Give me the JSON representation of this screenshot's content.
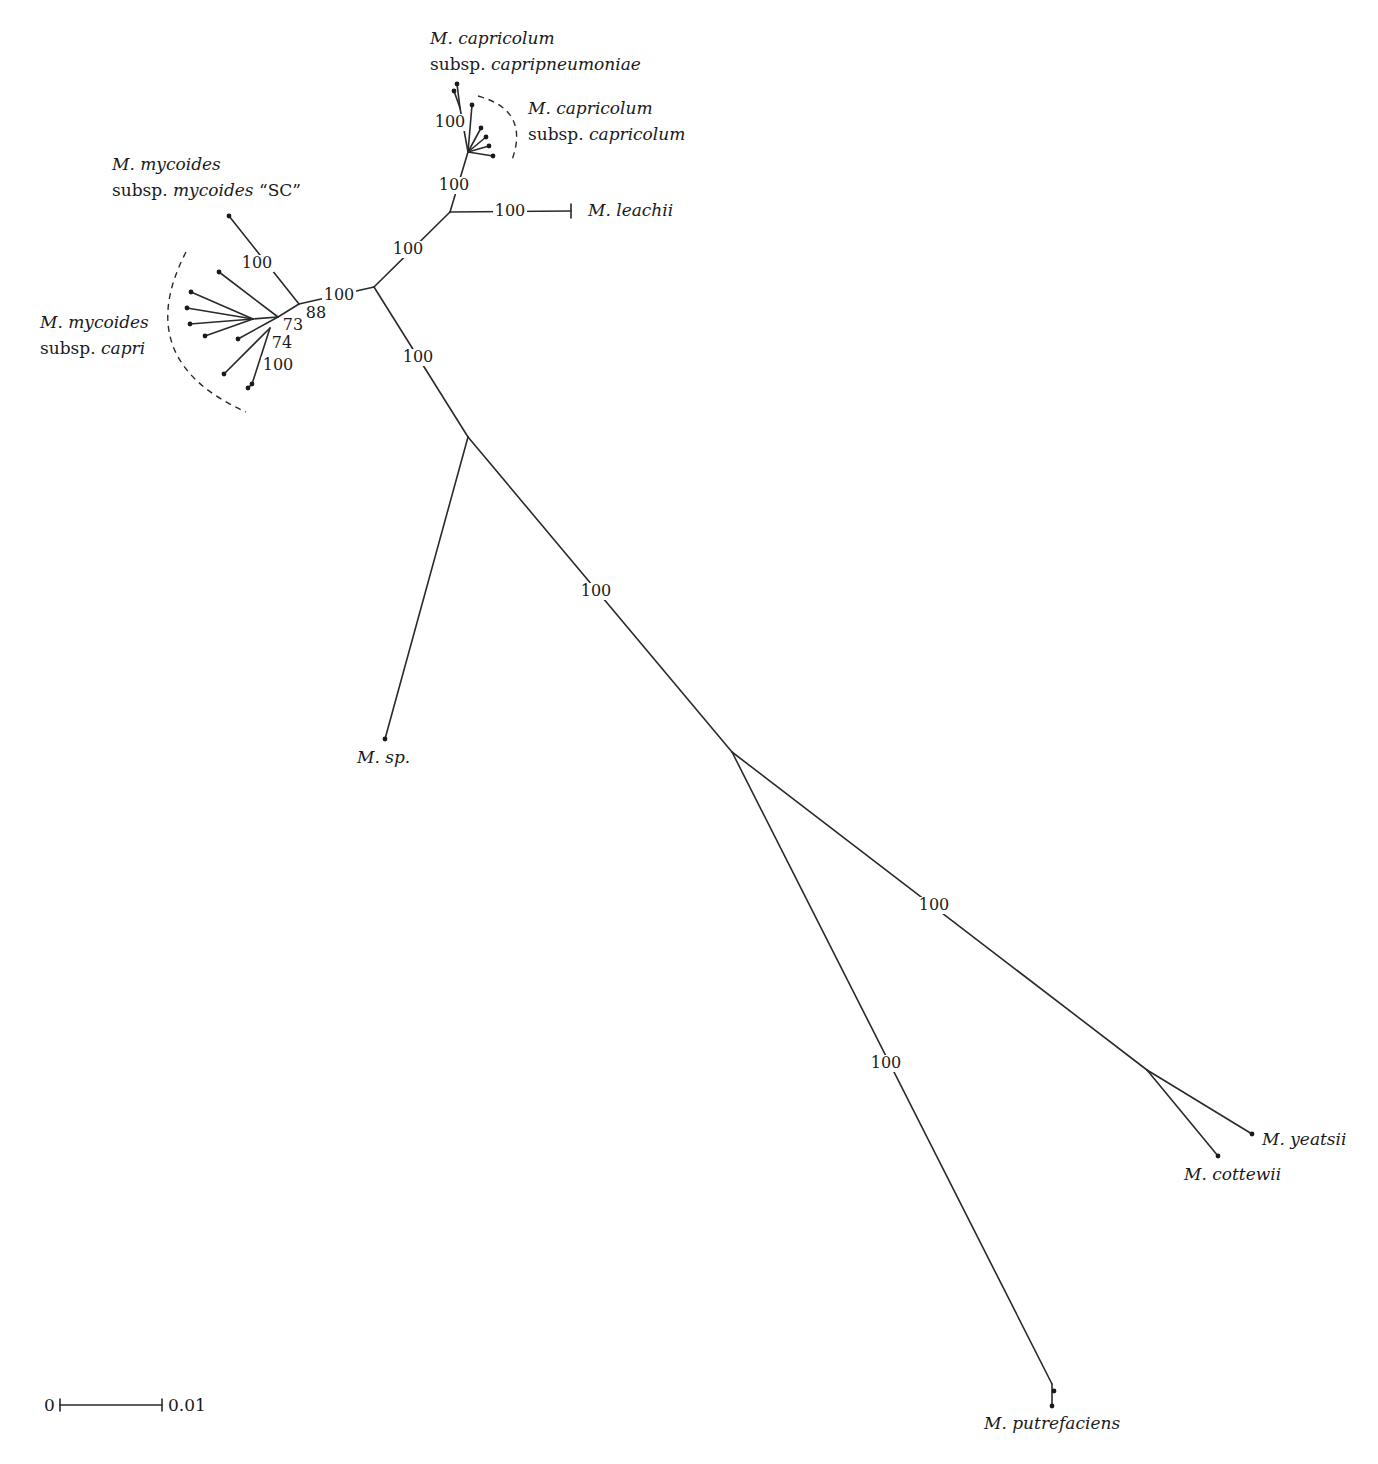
{
  "diagram": {
    "type": "unrooted phylogenetic tree",
    "scale_bar": {
      "left_label": "0",
      "right_label": "0.01",
      "x1": 60,
      "x2": 162,
      "y": 1405
    },
    "taxa": [
      {
        "id": "capripneumoniae",
        "line1": "M. capricolum",
        "line2_prefix": "subsp. ",
        "line2_italic": "capripneumoniae",
        "x": 430,
        "y1": 44,
        "y2": 70
      },
      {
        "id": "capricolum",
        "line1": "M. capricolum",
        "line2_prefix": "subsp. ",
        "line2_italic": "capricolum",
        "x": 528,
        "y1": 114,
        "y2": 140
      },
      {
        "id": "leachii",
        "line1": "M. leachii",
        "x": 588,
        "y1": 216
      },
      {
        "id": "mycoides_sc",
        "line1": "M. mycoides",
        "line2_prefix": "subsp. ",
        "line2_italic": "mycoides",
        "line2_suffix": " “SC”",
        "x": 112,
        "y1": 170,
        "y2": 196
      },
      {
        "id": "capri",
        "line1": "M. mycoides",
        "line2_prefix": "subsp. ",
        "line2_italic": "capri",
        "x": 40,
        "y1": 328,
        "y2": 354
      },
      {
        "id": "sp",
        "line1": "M. sp.",
        "x": 357,
        "y1": 763
      },
      {
        "id": "putrefaciens",
        "line1": "M. putrefaciens",
        "x": 984,
        "y1": 1429
      },
      {
        "id": "yeatsii",
        "line1": "M. yeatsii",
        "x": 1262,
        "y1": 1145
      },
      {
        "id": "cottewii",
        "line1": "M. cottewii",
        "x": 1184,
        "y1": 1180
      }
    ],
    "bootstrap_values": [
      {
        "value": "100",
        "x": 450,
        "y": 127
      },
      {
        "value": "100",
        "x": 454,
        "y": 190
      },
      {
        "value": "100",
        "x": 510,
        "y": 216
      },
      {
        "value": "100",
        "x": 408,
        "y": 254
      },
      {
        "value": "100",
        "x": 339,
        "y": 300
      },
      {
        "value": "100",
        "x": 257,
        "y": 268
      },
      {
        "value": "88",
        "x": 316,
        "y": 318
      },
      {
        "value": "73",
        "x": 293,
        "y": 330
      },
      {
        "value": "74",
        "x": 282,
        "y": 348
      },
      {
        "value": "100",
        "x": 278,
        "y": 370
      },
      {
        "value": "100",
        "x": 418,
        "y": 362
      },
      {
        "value": "100",
        "x": 596,
        "y": 596
      },
      {
        "value": "100",
        "x": 934,
        "y": 910
      },
      {
        "value": "100",
        "x": 886,
        "y": 1068
      }
    ],
    "branches": [
      [
        374,
        287,
        450,
        212
      ],
      [
        450,
        212,
        468,
        152
      ],
      [
        450,
        212,
        571,
        211
      ],
      [
        468,
        152,
        460,
        108
      ],
      [
        460,
        108,
        454,
        91
      ],
      [
        460,
        108,
        457,
        84
      ],
      [
        468,
        152,
        472,
        105
      ],
      [
        468,
        152,
        481,
        128
      ],
      [
        468,
        152,
        486,
        137
      ],
      [
        468,
        152,
        489,
        146
      ],
      [
        468,
        152,
        493,
        156
      ],
      [
        374,
        287,
        299,
        304
      ],
      [
        299,
        304,
        229,
        216
      ],
      [
        299,
        304,
        278,
        317
      ],
      [
        278,
        317,
        219,
        272
      ],
      [
        278,
        317,
        253,
        319
      ],
      [
        253,
        319,
        191,
        292
      ],
      [
        253,
        319,
        187,
        308
      ],
      [
        253,
        319,
        190,
        324
      ],
      [
        253,
        319,
        205,
        336
      ],
      [
        278,
        317,
        238,
        339
      ],
      [
        270,
        328,
        224,
        374
      ],
      [
        270,
        328,
        252,
        384
      ],
      [
        252,
        384,
        248,
        388
      ],
      [
        374,
        287,
        468,
        437
      ],
      [
        468,
        437,
        385,
        739
      ],
      [
        468,
        437,
        732,
        752
      ],
      [
        732,
        752,
        1052,
        1384
      ],
      [
        1052,
        1384,
        1052,
        1406
      ],
      [
        732,
        752,
        1147,
        1070
      ],
      [
        1147,
        1070,
        1252,
        1134
      ],
      [
        1147,
        1070,
        1218,
        1156
      ]
    ],
    "tips": [
      [
        454,
        91
      ],
      [
        457,
        84
      ],
      [
        472,
        105
      ],
      [
        481,
        128
      ],
      [
        486,
        137
      ],
      [
        489,
        146
      ],
      [
        493,
        156
      ],
      [
        229,
        216
      ],
      [
        219,
        272
      ],
      [
        191,
        292
      ],
      [
        187,
        308
      ],
      [
        190,
        324
      ],
      [
        205,
        336
      ],
      [
        238,
        339
      ],
      [
        224,
        374
      ],
      [
        248,
        388
      ],
      [
        252,
        384
      ],
      [
        385,
        739
      ],
      [
        1054,
        1391
      ],
      [
        1052,
        1406
      ],
      [
        1252,
        1134
      ],
      [
        1218,
        1156
      ]
    ],
    "clade_arcs": [
      {
        "id": "capricolum-arc",
        "d": "M 478 96 Q 530 110 512 160"
      },
      {
        "id": "capri-arc",
        "d": "M 186 252 Q 130 360 246 412"
      }
    ]
  }
}
